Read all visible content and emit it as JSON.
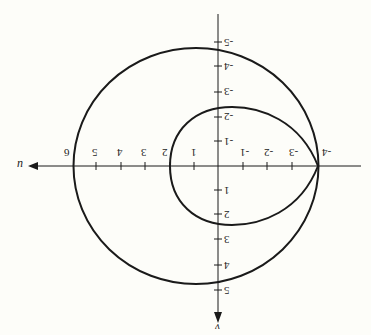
{
  "figure": {
    "orientation": "rotated 180 degrees",
    "axes": {
      "horizontal_label": "u",
      "vertical_label": "v",
      "u_ticks": [
        "-4",
        "-3",
        "-2",
        "-1",
        "1",
        "2",
        "3",
        "4",
        "5",
        "6"
      ],
      "v_ticks": [
        "-5",
        "-4",
        "-3",
        "-2",
        "-1",
        "1",
        "2",
        "3",
        "4",
        "5"
      ]
    },
    "curves": [
      {
        "name": "outer-circle",
        "u_range": [
          -4,
          6
        ],
        "v_range": [
          -4.8,
          4.8
        ]
      },
      {
        "name": "inner-loop",
        "u_range": [
          -4,
          2
        ],
        "v_range": [
          -2.4,
          2.4
        ]
      }
    ],
    "stroke_color": "#1a1a1a",
    "background_color": "#fdfdf9"
  }
}
